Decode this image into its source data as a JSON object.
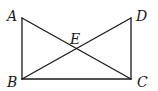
{
  "diagram": {
    "type": "geometry",
    "shape": "rectangle ABCD with diagonals AC and BD intersecting at E",
    "points": {
      "A": {
        "label": "A",
        "x": 22,
        "y": 18
      },
      "B": {
        "label": "B",
        "x": 22,
        "y": 79
      },
      "C": {
        "label": "C",
        "x": 131,
        "y": 79
      },
      "D": {
        "label": "D",
        "x": 131,
        "y": 18
      },
      "E": {
        "label": "E",
        "x": 76.5,
        "y": 48.5
      }
    },
    "segments": [
      {
        "name": "AB",
        "from": "A",
        "to": "B"
      },
      {
        "name": "BC",
        "from": "B",
        "to": "C"
      },
      {
        "name": "CD",
        "from": "C",
        "to": "D"
      },
      {
        "name": "AC",
        "from": "A",
        "to": "C"
      },
      {
        "name": "BD",
        "from": "B",
        "to": "D"
      }
    ],
    "labels": {
      "A": "A",
      "B": "B",
      "C": "C",
      "D": "D",
      "E": "E"
    },
    "colors": {
      "line": "#1a1a1a",
      "background": "#ffffff"
    }
  }
}
